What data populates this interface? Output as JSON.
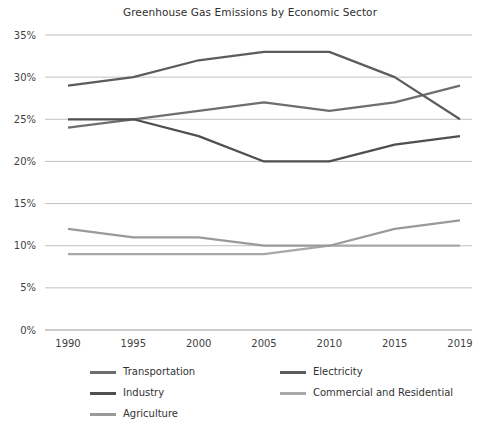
{
  "chart_data": {
    "type": "line",
    "title": "Greenhouse Gas Emissions by Economic Sector",
    "xlabel": "",
    "ylabel": "",
    "x": [
      "1990",
      "1995",
      "2000",
      "2005",
      "2010",
      "2015",
      "2019"
    ],
    "categories": [
      "1990",
      "1995",
      "2000",
      "2005",
      "2010",
      "2015",
      "2019"
    ],
    "ylim": [
      0,
      35
    ],
    "ytick_labels": [
      "0%",
      "5%",
      "10%",
      "15%",
      "20%",
      "25%",
      "30%",
      "35%"
    ],
    "ytick_values": [
      0,
      5,
      10,
      15,
      20,
      25,
      30,
      35
    ],
    "grid": true,
    "legend_position": "bottom",
    "series": [
      {
        "name": "Transportation",
        "color": "#6e6e6e",
        "values": [
          24,
          25,
          26,
          27,
          26,
          27,
          29
        ]
      },
      {
        "name": "Electricity",
        "color": "#5c5c5c",
        "values": [
          29,
          30,
          32,
          33,
          33,
          30,
          25
        ]
      },
      {
        "name": "Industry",
        "color": "#4f4f4f",
        "values": [
          25,
          25,
          23,
          20,
          20,
          22,
          23
        ]
      },
      {
        "name": "Commercial and Residential",
        "color": "#a8a8a8",
        "values": [
          9,
          9,
          9,
          9,
          10,
          10,
          10
        ]
      },
      {
        "name": "Agriculture",
        "color": "#9a9a9a",
        "values": [
          12,
          11,
          11,
          10,
          10,
          12,
          13
        ]
      }
    ]
  },
  "legend": {
    "items": [
      {
        "label": "Transportation",
        "color": "#6e6e6e"
      },
      {
        "label": "Electricity",
        "color": "#5c5c5c"
      },
      {
        "label": "Industry",
        "color": "#4f4f4f"
      },
      {
        "label": "Commercial and Residential",
        "color": "#a8a8a8"
      },
      {
        "label": "Agriculture",
        "color": "#9a9a9a"
      }
    ]
  }
}
